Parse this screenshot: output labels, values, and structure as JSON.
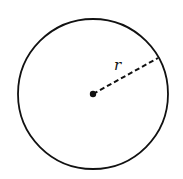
{
  "diagram": {
    "type": "circle-with-radius",
    "radius_label": "r",
    "stroke_color": "#111111",
    "background": "#ffffff",
    "circle": {
      "cx": 93,
      "cy": 94,
      "r": 75
    },
    "center_dot": {
      "cx": 93,
      "cy": 94,
      "r": 3
    },
    "radius_line": {
      "x1": 93,
      "y1": 94,
      "x2": 158,
      "y2": 58
    },
    "label_pos": {
      "x": 114,
      "y": 70
    }
  }
}
